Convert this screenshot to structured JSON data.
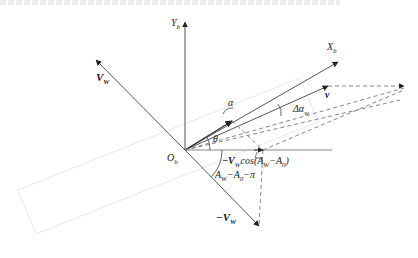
{
  "figure": {
    "type": "vector-diagram",
    "origin": {
      "label": "O",
      "sub": "b",
      "x": 185,
      "y": 150
    },
    "colors": {
      "line": "#555555",
      "arrow": "#222222",
      "faint_outline": "#e6e6e6",
      "text": "#222222"
    }
  },
  "labels": {
    "yb": {
      "main": "Y",
      "sub": "b"
    },
    "xb": {
      "main": "X",
      "sub": "b"
    },
    "vw": {
      "main": "V",
      "sub": "W"
    },
    "neg_vw": {
      "prefix": "−",
      "main": "V",
      "sub": "W"
    },
    "v": {
      "main": "v"
    },
    "alpha": {
      "main": "α"
    },
    "theta": {
      "main": "θ"
    },
    "delta_alpha": {
      "main": "Δα",
      "sub": "w"
    },
    "origin": {
      "main": "O",
      "sub": "b"
    },
    "projection": {
      "text": "−V",
      "sub": "W",
      "rest": "cos(A",
      "sub2": "W",
      "rest2": "−A",
      "sub3": "0",
      "end": ")"
    },
    "angle_aw": {
      "text": "A",
      "sub": "W",
      "rest": "−A",
      "sub2": "0",
      "end": "−π"
    }
  },
  "vectors": [
    {
      "name": "Yb-axis",
      "from": [
        185,
        150
      ],
      "to": [
        185,
        22
      ],
      "style": "solid"
    },
    {
      "name": "Xb-axis",
      "from": [
        185,
        150
      ],
      "to": [
        338,
        62
      ],
      "style": "solid"
    },
    {
      "name": "v",
      "from": [
        185,
        150
      ],
      "to": [
        328,
        86
      ],
      "style": "solid"
    },
    {
      "name": "VW",
      "from": [
        185,
        150
      ],
      "to": [
        96,
        60
      ],
      "style": "solid"
    },
    {
      "name": "neg-VW",
      "from": [
        185,
        150
      ],
      "to": [
        259,
        226
      ],
      "style": "solid"
    },
    {
      "name": "inner-component",
      "from": [
        185,
        150
      ],
      "to": [
        232,
        121
      ],
      "style": "solid"
    },
    {
      "name": "horizontal-ref",
      "from": [
        185,
        150
      ],
      "to": [
        332,
        150
      ],
      "style": "solid-light"
    }
  ]
}
